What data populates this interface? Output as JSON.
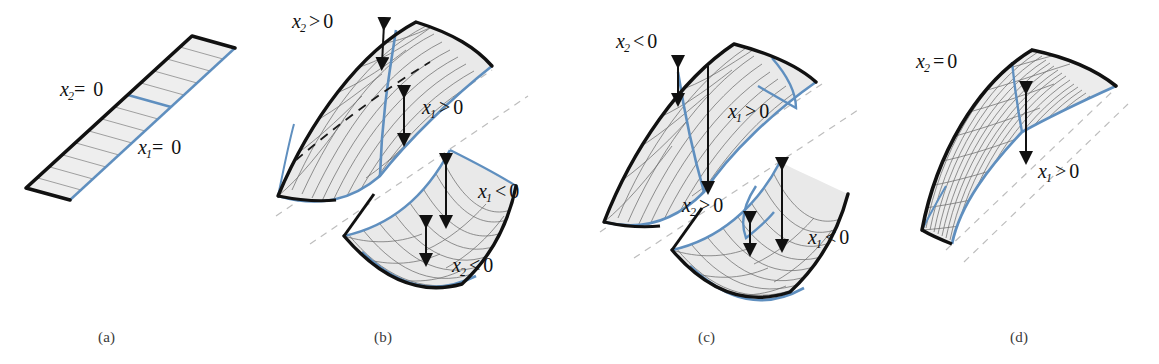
{
  "figure": {
    "background_color": "#ffffff",
    "colors": {
      "edge_black": "#111111",
      "mesh_grey": "#6b6b6b",
      "fill_grey": "#e9e9e9",
      "blue_curve": "#5f8fbf",
      "dashed_grey": "#b9b9b9",
      "arrow_black": "#111111",
      "caption_grey": "#3a3a3a"
    },
    "panels": [
      {
        "id": "a",
        "caption": "(a)",
        "description": "flat undeformed strip",
        "labels": [
          {
            "name": "x2-zero",
            "var": "x",
            "sub": "2",
            "op": "=",
            "value": "0"
          },
          {
            "name": "x1-zero",
            "var": "x",
            "sub": "1",
            "op": "=",
            "value": "0"
          }
        ]
      },
      {
        "id": "b",
        "caption": "(b)",
        "description": "two shells: upper bulges up, lower dips down",
        "labels": [
          {
            "name": "x2-positive",
            "var": "x",
            "sub": "2",
            "op": ">",
            "value": "0"
          },
          {
            "name": "x1-positive",
            "var": "x",
            "sub": "1",
            "op": ">",
            "value": "0"
          },
          {
            "name": "x1-negative",
            "var": "x",
            "sub": "1",
            "op": "<",
            "value": "0"
          },
          {
            "name": "x2-negative",
            "var": "x",
            "sub": "2",
            "op": "<",
            "value": "0"
          }
        ]
      },
      {
        "id": "c",
        "caption": "(c)",
        "description": "two shells with reversed rotation signs",
        "labels": [
          {
            "name": "x2-negative",
            "var": "x",
            "sub": "2",
            "op": "<",
            "value": "0"
          },
          {
            "name": "x1-positive",
            "var": "x",
            "sub": "1",
            "op": ">",
            "value": "0"
          },
          {
            "name": "x2-positive",
            "var": "x",
            "sub": "2",
            "op": ">",
            "value": "0"
          },
          {
            "name": "x1-negative",
            "var": "x",
            "sub": "1",
            "op": "<",
            "value": "0"
          }
        ]
      },
      {
        "id": "d",
        "caption": "(d)",
        "description": "single arched shell, pure translation",
        "labels": [
          {
            "name": "x2-zero",
            "var": "x",
            "sub": "2",
            "op": "=",
            "value": "0"
          },
          {
            "name": "x1-positive",
            "var": "x",
            "sub": "1",
            "op": ">",
            "value": "0"
          }
        ]
      }
    ]
  }
}
